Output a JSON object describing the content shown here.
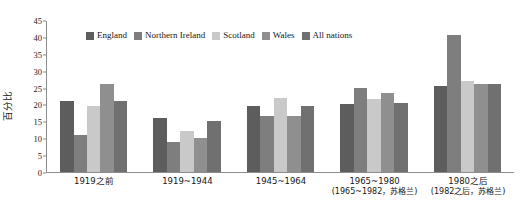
{
  "chart_data": {
    "type": "bar",
    "title": "",
    "xlabel": "",
    "ylabel": "百分比",
    "ylim": [
      0,
      45
    ],
    "ytick_step": 5,
    "yticks": [
      0,
      5,
      10,
      15,
      20,
      25,
      30,
      35,
      40,
      45
    ],
    "grid": false,
    "legend_position": "top-center",
    "categories": [
      "1919之前",
      "1919~1944",
      "1945~1964",
      "1965~1980",
      "1980之后"
    ],
    "category_sublabels": [
      "",
      "",
      "",
      "(1965~1982，苏格兰)",
      "(1982之后，苏格兰)"
    ],
    "series": [
      {
        "name": "England",
        "color": "#5d5d5d",
        "values": [
          21.0,
          16.0,
          19.5,
          20.0,
          25.5
        ]
      },
      {
        "name": "Northern Ireland",
        "color": "#7e7e7e",
        "values": [
          11.0,
          9.0,
          16.5,
          25.0,
          40.5
        ]
      },
      {
        "name": "Scotland",
        "color": "#c9c9c9",
        "values": [
          19.5,
          12.0,
          22.0,
          21.5,
          27.0
        ]
      },
      {
        "name": "Wales",
        "color": "#8f8f8f",
        "values": [
          26.0,
          10.0,
          16.5,
          23.5,
          26.0
        ]
      },
      {
        "name": "All nations",
        "color": "#707070",
        "values": [
          21.0,
          15.0,
          19.5,
          20.5,
          26.0
        ]
      }
    ]
  },
  "axis": {
    "y_title": "百分比"
  }
}
